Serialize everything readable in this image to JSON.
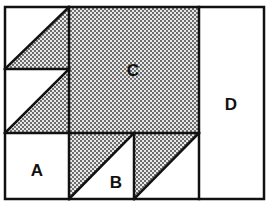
{
  "diagram": {
    "type": "quilt-block-layout",
    "regions": [
      {
        "id": "A",
        "label": "A",
        "shaded": false
      },
      {
        "id": "B",
        "label": "B",
        "shaded": false
      },
      {
        "id": "C",
        "label": "C",
        "shaded": true
      },
      {
        "id": "D",
        "label": "D",
        "shaded": false
      }
    ],
    "colors": {
      "line": "#111111",
      "background": "#ffffff",
      "dot": "#333333"
    }
  }
}
